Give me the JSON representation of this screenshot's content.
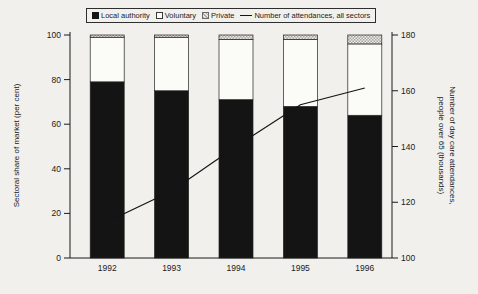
{
  "figure": {
    "background": "#f1f0ed",
    "ink": "#1b1b1b"
  },
  "legend": {
    "items": [
      {
        "label": "Local authority",
        "swatch": "solid-black"
      },
      {
        "label": "Voluntary",
        "swatch": "white-outline"
      },
      {
        "label": "Private",
        "swatch": "gray-crosshatch"
      },
      {
        "label": "Number of attendances, all sectors",
        "swatch": "line"
      }
    ]
  },
  "chart_data": {
    "type": "bar",
    "subtype": "stacked-percent-bars-with-line-overlay",
    "title": "",
    "categories": [
      "1992",
      "1993",
      "1994",
      "1995",
      "1996"
    ],
    "series": [
      {
        "name": "Local authority",
        "axis": "left",
        "style": "solid-black",
        "color": "#141414",
        "values": [
          79,
          75,
          71,
          68,
          64
        ]
      },
      {
        "name": "Voluntary",
        "axis": "left",
        "style": "white-outline",
        "color": "#fbfbf8",
        "values": [
          20,
          24,
          27,
          30,
          32
        ]
      },
      {
        "name": "Private",
        "axis": "left",
        "style": "gray-crosshatch",
        "color": "#a9a8a2",
        "values": [
          1,
          1,
          2,
          2,
          4
        ]
      }
    ],
    "line_series": {
      "name": "Number of attendances, all sectors",
      "axis": "right",
      "color": "#141414",
      "values": [
        113,
        124,
        140,
        155,
        161
      ]
    },
    "left_axis": {
      "label": "Sectoral share of market (per cent)",
      "min": 0,
      "max": 100,
      "ticks": [
        0,
        20,
        40,
        60,
        80,
        100
      ]
    },
    "right_axis": {
      "label": "Number of day care attendances, people over 65 (thousands)",
      "label_lines": [
        "Number of day care attendances,",
        "people over 65 (thousands)"
      ],
      "min": 100,
      "max": 180,
      "ticks": [
        100,
        120,
        140,
        160,
        180
      ]
    },
    "grid": false,
    "legend_position": "top-center"
  }
}
